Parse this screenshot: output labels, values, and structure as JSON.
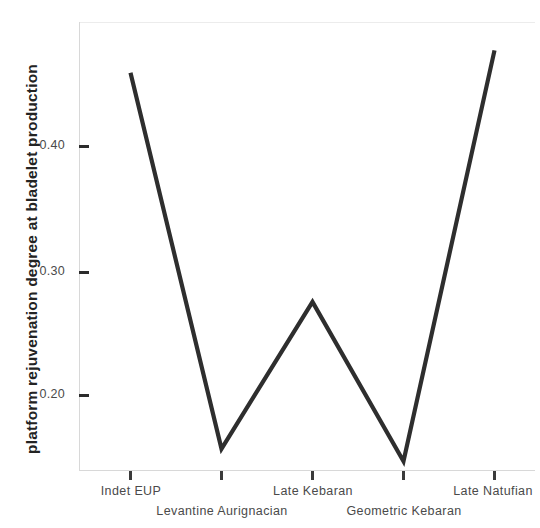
{
  "chart_data": {
    "type": "line",
    "title": "",
    "xlabel": "",
    "ylabel": "platform rejuvenation degree at bladelet production",
    "categories": [
      "Indet EUP",
      "Levantine Aurignacian",
      "Late Kebaran",
      "Geometric Kebaran",
      "Late Natufian"
    ],
    "values": [
      0.458,
      0.156,
      0.274,
      0.146,
      0.476
    ],
    "series": [
      {
        "name": "platform rejuvenation degree at bladelet production",
        "values": [
          0.458,
          0.156,
          0.274,
          0.146,
          0.476
        ]
      }
    ],
    "ytick_labels": [
      "0.40",
      "0.30",
      "0.20"
    ],
    "ytick_values": [
      0.4,
      0.3,
      0.2
    ],
    "ylim": [
      0.13,
      0.49
    ],
    "xlim": [
      0,
      4
    ],
    "grid": false,
    "legend": false,
    "legend_position": "none",
    "line_color": "#2e2e2e",
    "axis_color": "#d8d8d8",
    "tick_color": "#2c2c2c",
    "text_color": "#4a4a4a"
  },
  "axes": {
    "y": {
      "title": "platform rejuvenation degree at bladelet production",
      "ticks": [
        {
          "label": "0.40",
          "value": 0.4
        },
        {
          "label": "0.30",
          "value": 0.3
        },
        {
          "label": "0.20",
          "value": 0.2
        }
      ]
    },
    "x": {
      "ticks": [
        {
          "label": "Indet EUP",
          "row": 0
        },
        {
          "label": "Levantine Aurignacian",
          "row": 1
        },
        {
          "label": "Late Kebaran",
          "row": 0
        },
        {
          "label": "Geometric Kebaran",
          "row": 1
        },
        {
          "label": "Late Natufian",
          "row": 0
        }
      ]
    }
  }
}
